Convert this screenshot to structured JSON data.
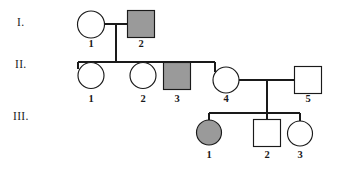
{
  "figure": {
    "kind": "pedigree-chart",
    "width": 346,
    "height": 173,
    "background_color": "#ffffff",
    "line_color": "#1a1a1a",
    "affected_fill": "#9a9a9a",
    "unaffected_fill": "#ffffff"
  },
  "generation_labels": [
    {
      "text": "I.",
      "x": 17,
      "y": 26
    },
    {
      "text": "II.",
      "x": 15,
      "y": 68
    },
    {
      "text": "III.",
      "x": 13,
      "y": 120
    }
  ],
  "individuals": [
    {
      "id": "I-1",
      "generation": "I",
      "number": "1",
      "sex": "female",
      "shape": "circle",
      "affected": false,
      "cx": 91,
      "cy": 24,
      "r": 13.5,
      "label_x": 91,
      "label_y": 47
    },
    {
      "id": "I-2",
      "generation": "I",
      "number": "2",
      "sex": "male",
      "shape": "square",
      "affected": true,
      "cx": 141,
      "cy": 24,
      "size": 27,
      "label_x": 141,
      "label_y": 47
    },
    {
      "id": "II-1",
      "generation": "II",
      "number": "1",
      "sex": "female",
      "shape": "circle",
      "affected": false,
      "cx": 91,
      "cy": 75,
      "r": 13,
      "label_x": 91,
      "label_y": 102
    },
    {
      "id": "II-2",
      "generation": "II",
      "number": "2",
      "sex": "female",
      "shape": "circle",
      "affected": false,
      "cx": 143,
      "cy": 75,
      "r": 13,
      "label_x": 143,
      "label_y": 102
    },
    {
      "id": "II-3",
      "generation": "II",
      "number": "3",
      "sex": "male",
      "shape": "square",
      "affected": true,
      "cx": 177,
      "cy": 76,
      "size": 27,
      "label_x": 177,
      "label_y": 102
    },
    {
      "id": "II-4",
      "generation": "II",
      "number": "4",
      "sex": "female",
      "shape": "circle",
      "affected": false,
      "cx": 226,
      "cy": 80,
      "r": 13,
      "label_x": 226,
      "label_y": 102
    },
    {
      "id": "II-5",
      "generation": "II",
      "number": "5",
      "sex": "male",
      "shape": "square",
      "affected": false,
      "cx": 308,
      "cy": 80,
      "size": 27,
      "label_x": 308,
      "label_y": 102
    },
    {
      "id": "III-1",
      "generation": "III",
      "number": "1",
      "sex": "female",
      "shape": "circle",
      "affected": true,
      "cx": 209,
      "cy": 132,
      "r": 12.5,
      "label_x": 209,
      "label_y": 158
    },
    {
      "id": "III-2",
      "generation": "III",
      "number": "2",
      "sex": "male",
      "shape": "square",
      "affected": false,
      "cx": 267,
      "cy": 133,
      "size": 27,
      "label_x": 267,
      "label_y": 158
    },
    {
      "id": "III-3",
      "generation": "III",
      "number": "3",
      "sex": "female",
      "shape": "circle",
      "affected": false,
      "cx": 300,
      "cy": 133,
      "r": 12.5,
      "label_x": 300,
      "label_y": 158
    }
  ],
  "connectors": [
    {
      "name": "mating-line-I1-I2",
      "d": "M 104.5 24 L 127.5 24"
    },
    {
      "name": "descent-line-gen1",
      "d": "M 116 24 L 116 62"
    },
    {
      "name": "sibship-line-gen2",
      "d": "M 78 62 L 215 62"
    },
    {
      "name": "drop-II-1",
      "d": "M 78 62 L 78 66"
    },
    {
      "name": "drop-II-2",
      "d": "M 143 62 L 143 62"
    },
    {
      "name": "drop-II-3",
      "d": "M 177 62 L 177 62.5"
    },
    {
      "name": "drop-II-4",
      "d": "M 215 62 L 215 67"
    },
    {
      "name": "stub-II-1-top",
      "d": "M 78 62 L 78 69"
    },
    {
      "name": "stub-II-4-top",
      "d": "M 215 62 L 215 72"
    },
    {
      "name": "mating-line-II4-II5",
      "d": "M 239 80 L 294.5 80"
    },
    {
      "name": "descent-line-gen2",
      "d": "M 267 80 L 267 113"
    },
    {
      "name": "sibship-line-gen3",
      "d": "M 209 113 L 300 113"
    },
    {
      "name": "drop-III-1",
      "d": "M 209 113 L 209 119.5"
    },
    {
      "name": "drop-III-2",
      "d": "M 267 113 L 267 119.5"
    },
    {
      "name": "drop-III-3",
      "d": "M 300 113 L 300 120.5"
    }
  ]
}
